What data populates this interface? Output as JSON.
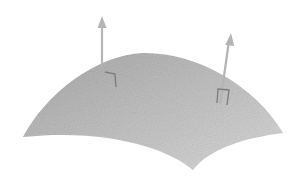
{
  "diagram": {
    "colors": {
      "background": "#ffffff",
      "surface_light": "#d4d4d4",
      "surface_dark": "#a8a8a8",
      "arrow": "#b4b4b4",
      "marker": "#8a8a8a"
    },
    "surface": {
      "left_corner": [
        23,
        137
      ],
      "peak": [
        143,
        53
      ],
      "right_corner": [
        283,
        133
      ],
      "bottom_point": [
        193,
        170
      ]
    },
    "normals": [
      {
        "id": "normal-left",
        "base": [
          102,
          68
        ],
        "tip": [
          102,
          17
        ]
      },
      {
        "id": "normal-right",
        "base": [
          220,
          104
        ],
        "tip": [
          231,
          34
        ]
      }
    ]
  }
}
